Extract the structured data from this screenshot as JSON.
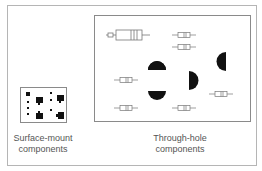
{
  "diagram": {
    "left_panel": {
      "caption_line1": "Surface-mount",
      "caption_line2": "components"
    },
    "right_panel": {
      "caption_line1": "Through-hole",
      "caption_line2": "components"
    },
    "colors": {
      "frame": "#b5b5b5",
      "board": "#8a8a8a",
      "component_fill": "#000000",
      "resistor_outline": "#777777"
    }
  }
}
